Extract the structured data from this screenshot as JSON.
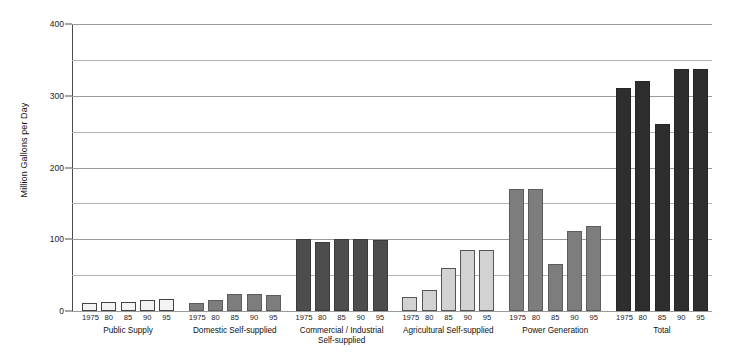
{
  "chart_data": {
    "type": "bar",
    "title": "",
    "xlabel": "",
    "ylabel": "Million Gallons per Day",
    "ylim": [
      0,
      400
    ],
    "yticks": [
      0,
      100,
      200,
      300,
      400
    ],
    "minor_gridlines": [
      50,
      150,
      250,
      350
    ],
    "grid": true,
    "legend": "none",
    "categories": [
      "1975",
      "80",
      "85",
      "90",
      "95"
    ],
    "groups": [
      {
        "name": "Public Supply",
        "shade": "light",
        "values": [
          11,
          13,
          13,
          16,
          17
        ]
      },
      {
        "name": "Domestic Self-supplied",
        "shade": "mid",
        "values": [
          11,
          16,
          24,
          24,
          23
        ]
      },
      {
        "name": "Commercial / Industrial\nSelf-supplied",
        "shade": "dark",
        "values": [
          101,
          96,
          101,
          101,
          99
        ]
      },
      {
        "name": "Agricultural Self-supplied",
        "shade": "lightgray",
        "values": [
          20,
          29,
          60,
          85,
          85
        ]
      },
      {
        "name": "Power Generation",
        "shade": "mid",
        "values": [
          170,
          170,
          65,
          112,
          118
        ]
      },
      {
        "name": "Total",
        "shade": "darkest",
        "values": [
          311,
          321,
          261,
          337,
          337
        ]
      }
    ]
  }
}
